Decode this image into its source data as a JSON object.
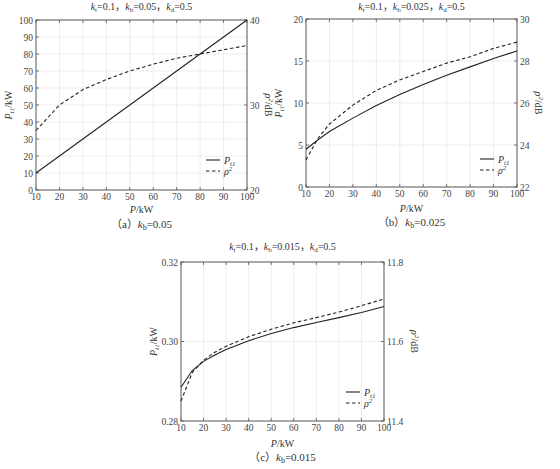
{
  "chart_data": [
    {
      "id": "a",
      "type": "line",
      "title": "k_t=0.1, k_b=0.05, k_d=0.5",
      "title_parts": {
        "kt": "0.1",
        "kb": "0.05",
        "kd": "0.5"
      },
      "caption": "(a) k_b=0.05",
      "caption_prefix": "（a）",
      "caption_k": "k",
      "caption_sub": "b",
      "caption_value": "=0.05",
      "xlabel": "P/kW",
      "ylabel_left": "P_t1/kW",
      "ylabel_right": "ρ²/dB",
      "xlim": [
        10,
        100
      ],
      "ylim_left": [
        0,
        100
      ],
      "ylim_right": [
        20,
        40
      ],
      "x_ticks": [
        10,
        20,
        30,
        40,
        50,
        60,
        70,
        80,
        90,
        100
      ],
      "y_ticks_left": [
        0,
        10,
        20,
        30,
        40,
        50,
        60,
        70,
        80,
        90,
        100
      ],
      "y_ticks_right": [
        20,
        30,
        40
      ],
      "grid": true,
      "legend": [
        "P_t1",
        "ρ²"
      ],
      "legend_position": "lower right",
      "x": [
        10,
        20,
        30,
        40,
        50,
        60,
        70,
        80,
        90,
        100
      ],
      "series": [
        {
          "name": "P_t1",
          "axis": "left",
          "style": "solid",
          "values": [
            10,
            20,
            30,
            40,
            50,
            60,
            70,
            80,
            90,
            100
          ]
        },
        {
          "name": "ρ²",
          "axis": "right",
          "style": "dashed",
          "values": [
            27.0,
            30.0,
            31.8,
            33.0,
            34.0,
            34.8,
            35.5,
            36.0,
            36.5,
            37.0
          ]
        }
      ]
    },
    {
      "id": "b",
      "type": "line",
      "title": "k_t=0.1, k_b=0.025, k_d=0.5",
      "title_parts": {
        "kt": "0.1",
        "kb": "0.025",
        "kd": "0.5"
      },
      "caption": "(b) k_b=0.025",
      "caption_prefix": "（b）",
      "caption_k": "k",
      "caption_sub": "b",
      "caption_value": "=0.025",
      "xlabel": "P/kW",
      "ylabel_left": "P_t1/kW",
      "ylabel_right": "ρ²/dB",
      "xlim": [
        10,
        100
      ],
      "ylim_left": [
        0,
        20
      ],
      "ylim_right": [
        22,
        30
      ],
      "x_ticks": [
        10,
        20,
        30,
        40,
        50,
        60,
        70,
        80,
        90,
        100
      ],
      "y_ticks_left": [
        0,
        5,
        10,
        15,
        20
      ],
      "y_ticks_right": [
        22,
        24,
        26,
        28,
        30
      ],
      "grid": true,
      "legend": [
        "P_t1",
        "ρ²"
      ],
      "legend_position": "lower right",
      "x": [
        10,
        15,
        20,
        30,
        40,
        50,
        60,
        70,
        80,
        90,
        100
      ],
      "series": [
        {
          "name": "P_t1",
          "axis": "left",
          "style": "solid",
          "values": [
            4.5,
            5.6,
            6.6,
            8.2,
            9.7,
            11.0,
            12.2,
            13.3,
            14.3,
            15.3,
            16.2
          ]
        },
        {
          "name": "ρ²",
          "axis": "right",
          "style": "dashed",
          "values": [
            23.3,
            24.3,
            25.0,
            25.9,
            26.6,
            27.1,
            27.5,
            27.9,
            28.2,
            28.6,
            28.9
          ]
        }
      ]
    },
    {
      "id": "c",
      "type": "line",
      "title": "k_t=0.1, k_b=0.015, k_d=0.5",
      "title_parts": {
        "kt": "0.1",
        "kb": "0.015",
        "kd": "0.5"
      },
      "caption": "(c) k_b=0.015",
      "caption_prefix": "（c）",
      "caption_k": "k",
      "caption_sub": "b",
      "caption_value": "=0.015",
      "xlabel": "P/kW",
      "ylabel_left": "P_t1/kW",
      "ylabel_right": "ρ²/dB",
      "xlim": [
        10,
        100
      ],
      "ylim_left": [
        0.28,
        0.32
      ],
      "ylim_right": [
        11.4,
        11.8
      ],
      "x_ticks": [
        10,
        20,
        30,
        40,
        50,
        60,
        70,
        80,
        90,
        100
      ],
      "y_ticks_left": [
        0.28,
        0.3,
        0.32
      ],
      "y_ticks_right": [
        11.4,
        11.6,
        11.8
      ],
      "grid": true,
      "legend": [
        "P_t1",
        "ρ²"
      ],
      "legend_position": "lower right",
      "x": [
        10,
        15,
        20,
        25,
        30,
        40,
        50,
        60,
        70,
        80,
        90,
        100
      ],
      "series": [
        {
          "name": "P_t1",
          "axis": "left",
          "style": "solid",
          "values": [
            0.2885,
            0.2927,
            0.295,
            0.2966,
            0.298,
            0.3002,
            0.302,
            0.3035,
            0.3048,
            0.306,
            0.3073,
            0.3088
          ]
        },
        {
          "name": "ρ²",
          "axis": "right",
          "style": "dashed",
          "values": [
            11.45,
            11.522,
            11.553,
            11.573,
            11.588,
            11.612,
            11.631,
            11.647,
            11.66,
            11.674,
            11.69,
            11.707
          ]
        }
      ]
    }
  ],
  "layout": [
    {
      "left": 36,
      "top": 20,
      "right": 247,
      "bottom": 190,
      "caption_y": 228,
      "xlabel_y": 213,
      "title_y": 10,
      "legend_x": 206,
      "legend_y": 160
    },
    {
      "left": 306,
      "top": 19,
      "right": 517,
      "bottom": 187,
      "caption_y": 226,
      "xlabel_y": 212,
      "title_y": 10,
      "legend_x": 480,
      "legend_y": 159
    },
    {
      "left": 181,
      "top": 262,
      "right": 384,
      "bottom": 421,
      "caption_y": 461,
      "xlabel_y": 447,
      "title_y": 250,
      "legend_x": 346,
      "legend_y": 392
    }
  ]
}
